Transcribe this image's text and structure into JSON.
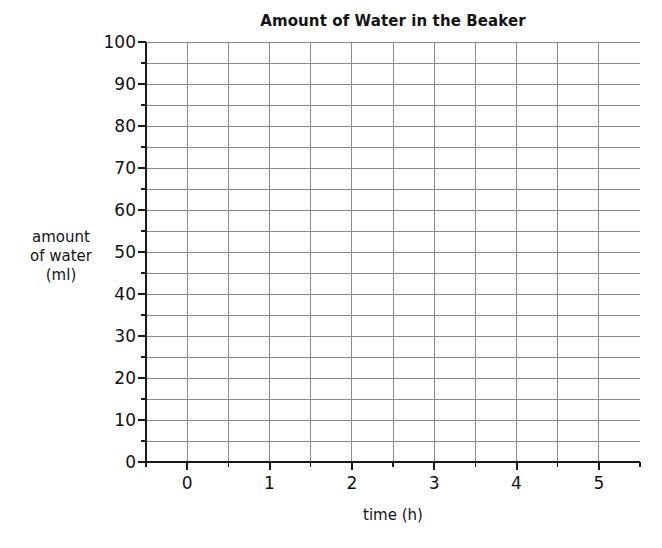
{
  "chart_data": {
    "type": "line",
    "title": "Amount of Water in the Beaker",
    "xlabel": "time (h)",
    "ylabel_lines": [
      "amount",
      "of water",
      "(ml)"
    ],
    "ylabel": "amount of water (ml)",
    "x": [],
    "values": [],
    "series": [],
    "xlim": [
      -0.5,
      5.5
    ],
    "ylim": [
      0,
      100
    ],
    "x_major_ticks": [
      0,
      1,
      2,
      3,
      4,
      5
    ],
    "x_major_tick_labels": [
      "0",
      "1",
      "2",
      "3",
      "4",
      "5"
    ],
    "x_minor_tick_step": 0.5,
    "y_major_ticks": [
      0,
      10,
      20,
      30,
      40,
      50,
      60,
      70,
      80,
      90,
      100
    ],
    "y_major_tick_labels": [
      "0",
      "10",
      "20",
      "30",
      "40",
      "50",
      "60",
      "70",
      "80",
      "90",
      "100"
    ],
    "y_minor_tick_step": 5,
    "grid": true,
    "grid_x_step": 0.5,
    "grid_y_step": 5,
    "grid_color": "#8a8a8a",
    "axis_color": "#1a1a1a",
    "background_color": "#ffffff",
    "legend": null,
    "annotations": [],
    "note": "Empty grid — no data plotted"
  },
  "figure": {
    "title": "Amount of Water in the Beaker",
    "xlabel": "time (h)",
    "ylabel_lines": [
      "amount",
      "of water",
      "(ml)"
    ]
  }
}
